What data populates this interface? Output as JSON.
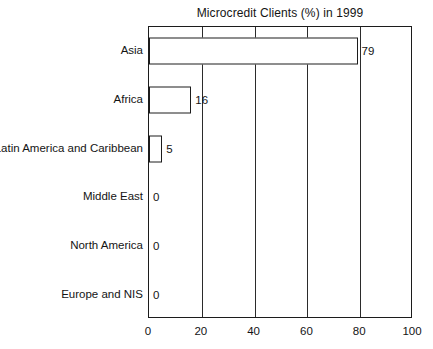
{
  "chart_data": {
    "type": "bar",
    "orientation": "horizontal",
    "title": "Microcredit Clients (%) in 1999",
    "xlabel": "",
    "ylabel": "",
    "categories": [
      "Asia",
      "Africa",
      "Latin America and Caribbean",
      "Middle East",
      "North America",
      "Europe and NIS"
    ],
    "values": [
      79,
      16,
      5,
      0,
      0,
      0
    ],
    "value_labels": [
      "79",
      "16",
      "5",
      "0",
      "0",
      "0"
    ],
    "xlim": [
      0,
      100
    ],
    "xticks": [
      0,
      20,
      40,
      60,
      80,
      100
    ],
    "xtick_labels": [
      "0",
      "20",
      "40",
      "60",
      "80",
      "100"
    ],
    "gridlines": [
      20,
      40,
      60,
      80
    ],
    "grid": true,
    "legend": false,
    "bar_fill_color": "#ffffff",
    "bar_edge_color": "#1c1c1c",
    "axis_color": "#1c1c1c",
    "text_color": "#141414",
    "background_color": "#ffffff"
  }
}
